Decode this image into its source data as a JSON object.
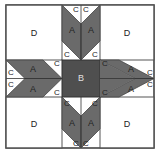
{
  "diagram": {
    "colors": {
      "dark": "#6a6a6a",
      "center": "#4f4f4f",
      "light": "#ffffff",
      "border": "#555555"
    },
    "labels": {
      "corner": "D",
      "center": "B",
      "arm": "A",
      "triangle": "C"
    },
    "pieces": [
      {
        "id": "D",
        "count": 4,
        "description": "corner squares"
      },
      {
        "id": "B",
        "count": 1,
        "description": "center square"
      },
      {
        "id": "A",
        "count": 8,
        "description": "parallelograms"
      },
      {
        "id": "C",
        "count": 16,
        "description": "triangles"
      }
    ]
  }
}
